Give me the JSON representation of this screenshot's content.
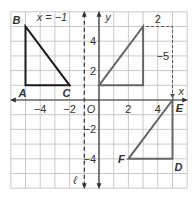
{
  "grid": {
    "x_min": -6,
    "x_max": 6,
    "y_min": -6,
    "y_max": 6,
    "origin_px": [
      99,
      100
    ],
    "cell_px": 14.7,
    "grid_color": "#bdbdbd",
    "axis_color": "#333333"
  },
  "axes": {
    "x_label": "x",
    "y_label": "y",
    "origin_label": "O",
    "x_ticks": [
      {
        "value": -4,
        "label": "−4"
      },
      {
        "value": -2,
        "label": "−2"
      },
      {
        "value": 2,
        "label": "2"
      },
      {
        "value": 4,
        "label": "4"
      }
    ],
    "y_ticks": [
      {
        "value": 4,
        "label": "4"
      },
      {
        "value": 2,
        "label": "2"
      },
      {
        "value": -2,
        "label": "−2"
      },
      {
        "value": -4,
        "label": "−4"
      }
    ]
  },
  "reflection_line": {
    "equation": "x = −1",
    "name": "ℓ",
    "x": -1,
    "color": "#333333"
  },
  "shapes": {
    "triangle_abc": {
      "color": "#1a1a1a",
      "vertices": [
        {
          "name": "B",
          "x": -5,
          "y": 5
        },
        {
          "name": "A",
          "x": -5,
          "y": 1
        },
        {
          "name": "C",
          "x": -2,
          "y": 1
        }
      ]
    },
    "image_triangle": {
      "color": "#666666",
      "vertices": [
        {
          "x": 0,
          "y": 1
        },
        {
          "x": 3,
          "y": 5
        },
        {
          "x": 3,
          "y": 1
        }
      ]
    },
    "triangle_def": {
      "color": "#666666",
      "vertices": [
        {
          "name": "E",
          "x": 5,
          "y": 0
        },
        {
          "name": "F",
          "x": 2,
          "y": -4
        },
        {
          "name": "D",
          "x": 5,
          "y": -4
        }
      ]
    }
  },
  "translation": {
    "horizontal_label": "2",
    "vertical_label": "−5",
    "color": "#555555"
  }
}
